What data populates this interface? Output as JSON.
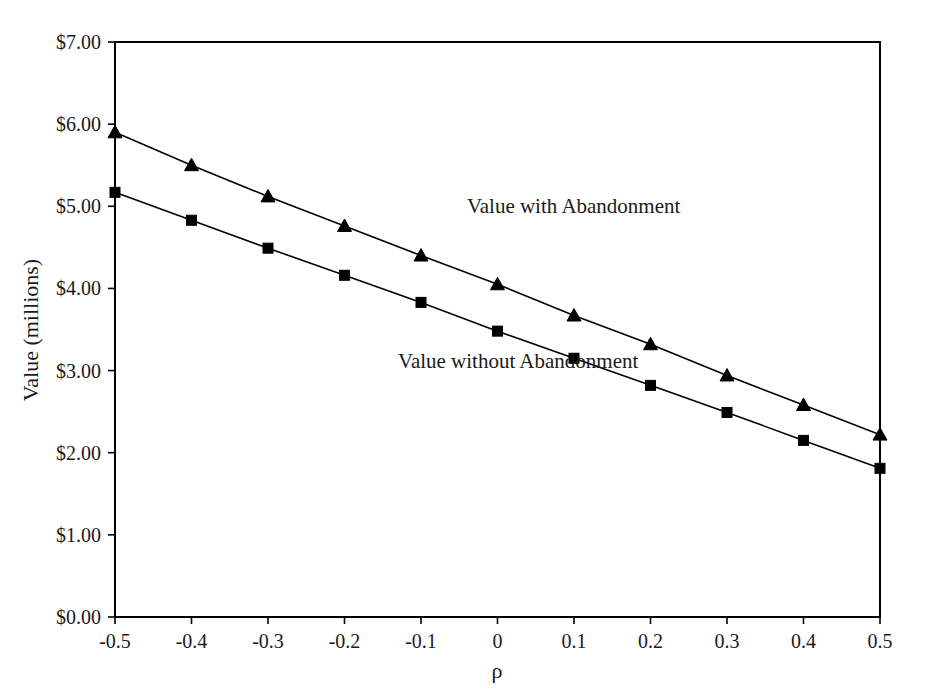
{
  "chart_data": {
    "type": "line",
    "title": "",
    "subtitle": "",
    "xlabel": "ρ",
    "ylabel": "Value (millions)",
    "x": [
      -0.5,
      -0.4,
      -0.3,
      -0.2,
      -0.1,
      0,
      0.1,
      0.2,
      0.3,
      0.4,
      0.5
    ],
    "xtick_labels": [
      "-0.5",
      "-0.4",
      "-0.3",
      "-0.2",
      "-0.1",
      "0",
      "0.1",
      "0.2",
      "0.3",
      "0.4",
      "0.5"
    ],
    "ytick_values": [
      0,
      1,
      2,
      3,
      4,
      5,
      6,
      7
    ],
    "ytick_labels": [
      "$0.00",
      "$1.00",
      "$2.00",
      "$3.00",
      "$4.00",
      "$5.00",
      "$6.00",
      "$7.00"
    ],
    "xlim": [
      -0.5,
      0.5
    ],
    "ylim": [
      0,
      7
    ],
    "grid": false,
    "legend_position": "inline-annotation",
    "series": [
      {
        "name": "Value with Abandonment",
        "marker": "triangle",
        "color": "#000000",
        "annotation": "Value with Abandonment",
        "values": [
          5.9,
          5.5,
          5.12,
          4.76,
          4.4,
          4.05,
          3.67,
          3.32,
          2.94,
          2.58,
          2.22
        ]
      },
      {
        "name": "Value without Abandonment",
        "marker": "square",
        "color": "#000000",
        "annotation": "Value without Abandonment",
        "values": [
          5.17,
          4.83,
          4.49,
          4.16,
          3.83,
          3.48,
          3.15,
          2.82,
          2.49,
          2.15,
          1.81
        ]
      }
    ],
    "annotations": [
      {
        "text": "Value with Abandonment",
        "x": -0.04,
        "y": 4.92
      },
      {
        "text": "Value without Abandonment",
        "x": -0.13,
        "y": 3.03
      }
    ]
  },
  "axes": {
    "y_title": "Value (millions)",
    "x_title": "ρ"
  }
}
